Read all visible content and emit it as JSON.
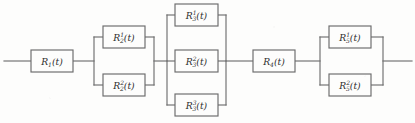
{
  "diagram": {
    "type": "reliability-block-diagram",
    "title": "",
    "background_color": "#fdfdfc",
    "line_color": "#6f6f6f",
    "text_color": "#2e2e2e",
    "variable": "R",
    "argument": "(t)",
    "input_lead": {
      "x1": 4,
      "x2": 31,
      "y": 61
    },
    "output_lead": {
      "x1": 383,
      "x2": 412,
      "y": 61
    },
    "stages": [
      {
        "id": "stage-1",
        "subscript": "1",
        "arrangement": "series",
        "blocks": [
          {
            "id": "block-r1",
            "base": "R",
            "sub": "1",
            "sup": "",
            "arg": "(t)",
            "text": "R1(t)",
            "x": 31,
            "y": 50,
            "w": 42,
            "h": 22
          }
        ]
      },
      {
        "id": "stage-2",
        "subscript": "2",
        "arrangement": "parallel",
        "bus_left_x": 94,
        "bus_right_x": 154,
        "bus_top_y": 37,
        "bus_bottom_y": 85,
        "blocks": [
          {
            "id": "block-r2-1",
            "base": "R",
            "sub": "2",
            "sup": "1",
            "arg": "(t)",
            "text": "R2^1(t)",
            "x": 103,
            "y": 26,
            "w": 42,
            "h": 22
          },
          {
            "id": "block-r2-2",
            "base": "R",
            "sub": "2",
            "sup": "2",
            "arg": "(t)",
            "text": "R2^2(t)",
            "x": 103,
            "y": 74,
            "w": 42,
            "h": 22
          }
        ]
      },
      {
        "id": "stage-3",
        "subscript": "3",
        "arrangement": "parallel",
        "bus_left_x": 167,
        "bus_right_x": 226,
        "bus_top_y": 15,
        "bus_bottom_y": 105,
        "blocks": [
          {
            "id": "block-r3-1",
            "base": "R",
            "sub": "3",
            "sup": "1",
            "arg": "(t)",
            "text": "R3^1(t)",
            "x": 175,
            "y": 4,
            "w": 43,
            "h": 22
          },
          {
            "id": "block-r3-2",
            "base": "R",
            "sub": "3",
            "sup": "2",
            "arg": "(t)",
            "text": "R3^2(t)",
            "x": 175,
            "y": 50,
            "w": 43,
            "h": 22
          },
          {
            "id": "block-r3-3",
            "base": "R",
            "sub": "3",
            "sup": "3",
            "arg": "(t)",
            "text": "R3^3(t)",
            "x": 175,
            "y": 94,
            "w": 43,
            "h": 22
          }
        ]
      },
      {
        "id": "stage-4",
        "subscript": "4",
        "arrangement": "series",
        "blocks": [
          {
            "id": "block-r4",
            "base": "R",
            "sub": "4",
            "sup": "",
            "arg": "(t)",
            "text": "R4(t)",
            "x": 253,
            "y": 50,
            "w": 42,
            "h": 22
          }
        ]
      },
      {
        "id": "stage-5",
        "subscript": "5",
        "arrangement": "parallel",
        "bus_left_x": 320,
        "bus_right_x": 383,
        "bus_top_y": 37,
        "bus_bottom_y": 85,
        "blocks": [
          {
            "id": "block-r5-1",
            "base": "R",
            "sub": "5",
            "sup": "1",
            "arg": "(t)",
            "text": "R5^1(t)",
            "x": 329,
            "y": 26,
            "w": 42,
            "h": 22
          },
          {
            "id": "block-r5-2",
            "base": "R",
            "sub": "5",
            "sup": "2",
            "arg": "(t)",
            "text": "R5^2(t)",
            "x": 329,
            "y": 74,
            "w": 42,
            "h": 22
          }
        ]
      }
    ],
    "connectors": [
      {
        "id": "lead-in",
        "x1": 4,
        "y1": 61,
        "x2": 31,
        "y2": 61
      },
      {
        "id": "s1-to-s2",
        "x1": 73,
        "y1": 61,
        "x2": 94,
        "y2": 61
      },
      {
        "id": "s2-to-s3",
        "x1": 154,
        "y1": 61,
        "x2": 167,
        "y2": 61
      },
      {
        "id": "s3-to-s4",
        "x1": 226,
        "y1": 61,
        "x2": 253,
        "y2": 61
      },
      {
        "id": "s4-to-s5",
        "x1": 295,
        "y1": 61,
        "x2": 320,
        "y2": 61
      },
      {
        "id": "lead-out",
        "x1": 383,
        "y1": 61,
        "x2": 412,
        "y2": 61
      }
    ]
  }
}
